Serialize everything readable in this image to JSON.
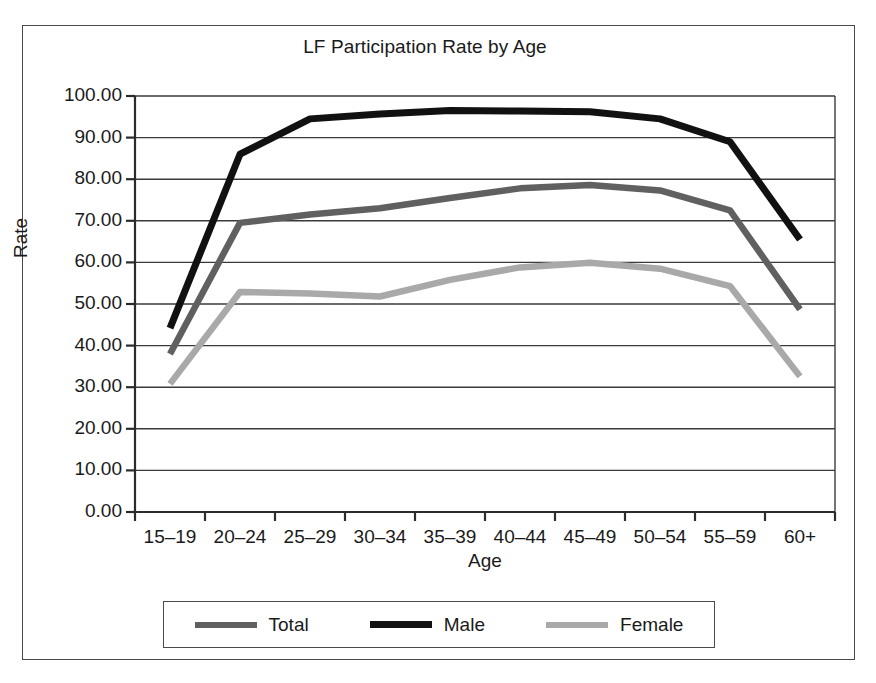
{
  "chart_data": {
    "type": "line",
    "title": "LF Participation Rate by Age",
    "xlabel": "Age",
    "ylabel": "Rate",
    "categories": [
      "15–19",
      "20–24",
      "25–29",
      "30–34",
      "35–39",
      "40–44",
      "45–49",
      "50–54",
      "55–59",
      "60+"
    ],
    "ylim": [
      0,
      100
    ],
    "yticks": [
      0,
      10,
      20,
      30,
      40,
      50,
      60,
      70,
      80,
      90,
      100
    ],
    "ytick_labels": [
      "0.00",
      "10.00",
      "20.00",
      "30.00",
      "40.00",
      "50.00",
      "60.00",
      "70.00",
      "80.00",
      "90.00",
      "100.00"
    ],
    "grid": "horizontal",
    "legend_position": "bottom",
    "series": [
      {
        "name": "Total",
        "color": "#606060",
        "values": [
          38.0,
          69.5,
          71.5,
          73.0,
          75.5,
          77.8,
          78.6,
          77.3,
          72.5,
          48.7
        ]
      },
      {
        "name": "Male",
        "color": "#111111",
        "values": [
          44.2,
          86.0,
          94.5,
          95.7,
          96.5,
          96.4,
          96.2,
          94.5,
          89.0,
          65.5
        ]
      },
      {
        "name": "Female",
        "color": "#a9a9a9",
        "values": [
          30.8,
          52.9,
          52.5,
          51.8,
          55.8,
          58.8,
          59.9,
          58.5,
          54.3,
          32.6
        ]
      }
    ]
  },
  "legend": {
    "items": [
      {
        "label": "Total",
        "color": "#606060"
      },
      {
        "label": "Male",
        "color": "#111111"
      },
      {
        "label": "Female",
        "color": "#a9a9a9"
      }
    ]
  },
  "axes": {
    "axis_color": "#2b2b2b",
    "grid_color": "#3a3a3a",
    "frame_color": "#4a4a4a"
  }
}
